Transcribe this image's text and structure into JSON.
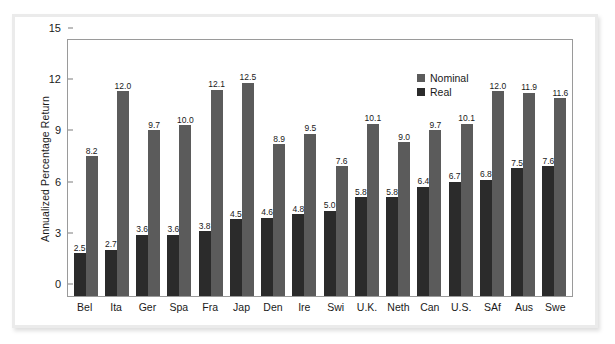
{
  "chart_data": {
    "type": "bar",
    "title": "",
    "xlabel": "",
    "ylabel": "Annualized Percentage Return",
    "ylim": [
      0,
      15
    ],
    "yticks": [
      0,
      3,
      6,
      9,
      12,
      15
    ],
    "grid": false,
    "legend_position": "top-right-inside",
    "categories": [
      "Bel",
      "Ita",
      "Ger",
      "Spa",
      "Fra",
      "Jap",
      "Den",
      "Ire",
      "Swi",
      "U.K.",
      "Neth",
      "Can",
      "U.S.",
      "SAf",
      "Aus",
      "Swe"
    ],
    "series": [
      {
        "name": "Real",
        "color": "#2b2b2b",
        "values": [
          2.5,
          2.7,
          3.6,
          3.6,
          3.8,
          4.5,
          4.6,
          4.8,
          5.0,
          5.8,
          5.8,
          6.4,
          6.7,
          6.8,
          7.5,
          7.6
        ]
      },
      {
        "name": "Nominal",
        "color": "#5b5b5b",
        "values": [
          8.2,
          12.0,
          9.7,
          10.0,
          12.1,
          12.5,
          8.9,
          9.5,
          7.6,
          10.1,
          9.0,
          9.7,
          10.1,
          12.0,
          11.9,
          11.6
        ]
      }
    ]
  },
  "legend": {
    "items": [
      {
        "label": "Nominal",
        "color": "#5b5b5b"
      },
      {
        "label": "Real",
        "color": "#2b2b2b"
      }
    ]
  }
}
